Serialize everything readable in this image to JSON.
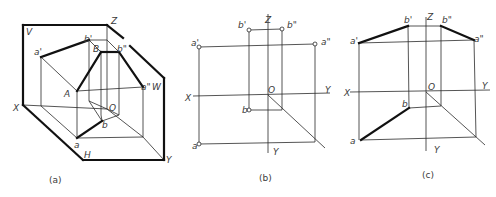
{
  "figure": {
    "colors": {
      "line": "#2a2a2a",
      "thick": "#111111",
      "text": "#3a3a3a",
      "background": "#ffffff"
    },
    "panels": [
      {
        "id": "a",
        "caption": "(a)",
        "caption_pos": [
          49,
          183
        ],
        "labels": [
          {
            "t": "V",
            "x": 26,
            "y": 35
          },
          {
            "t": "Z",
            "x": 111,
            "y": 24
          },
          {
            "t": "b'",
            "x": 84,
            "y": 42
          },
          {
            "t": "B",
            "x": 93,
            "y": 52
          },
          {
            "t": "b\"",
            "x": 117,
            "y": 52
          },
          {
            "t": "a'",
            "x": 34,
            "y": 55
          },
          {
            "t": "a\"",
            "x": 141,
            "y": 90
          },
          {
            "t": "W",
            "x": 152,
            "y": 90
          },
          {
            "t": "A",
            "x": 64,
            "y": 97
          },
          {
            "t": "X",
            "x": 13,
            "y": 111
          },
          {
            "t": "O",
            "x": 109,
            "y": 111
          },
          {
            "t": "b",
            "x": 102,
            "y": 128
          },
          {
            "t": "a",
            "x": 74,
            "y": 148
          },
          {
            "t": "H",
            "x": 84,
            "y": 158
          },
          {
            "t": "Y",
            "x": 166,
            "y": 163
          }
        ],
        "thick_lines": [
          [
            [
              23,
              25
            ],
            [
              107,
              25
            ]
          ],
          [
            [
              23,
              25
            ],
            [
              23,
              105
            ]
          ],
          [
            [
              23,
              105
            ],
            [
              83,
              160
            ]
          ],
          [
            [
              83,
              160
            ],
            [
              164,
              160
            ]
          ],
          [
            [
              164,
              160
            ],
            [
              164,
              78
            ]
          ],
          [
            [
              164,
              78
            ],
            [
              130,
              46
            ]
          ],
          [
            [
              107,
              25
            ],
            [
              123,
              38
            ]
          ],
          [
            [
              41,
              57
            ],
            [
              89,
              40
            ]
          ],
          [
            [
              77,
              91
            ],
            [
              101,
              52
            ]
          ],
          [
            [
              101,
              52
            ],
            [
              119,
              52
            ]
          ],
          [
            [
              119,
              52
            ],
            [
              143,
              87
            ]
          ],
          [
            [
              77,
              138
            ],
            [
              102,
              121
            ]
          ]
        ],
        "thin_lines": [
          [
            [
              41,
              57
            ],
            [
              77,
              91
            ]
          ],
          [
            [
              41,
              57
            ],
            [
              41,
              106
            ]
          ],
          [
            [
              89,
              40
            ],
            [
              107,
              40
            ]
          ],
          [
            [
              89,
              40
            ],
            [
              89,
              101
            ]
          ],
          [
            [
              89,
              40
            ],
            [
              101,
              52
            ]
          ],
          [
            [
              107,
              25
            ],
            [
              107,
              109
            ]
          ],
          [
            [
              107,
              40
            ],
            [
              119,
              52
            ]
          ],
          [
            [
              77,
              91
            ],
            [
              143,
              87
            ]
          ],
          [
            [
              77,
              91
            ],
            [
              77,
              138
            ]
          ],
          [
            [
              101,
              52
            ],
            [
              101,
              115
            ]
          ],
          [
            [
              119,
              52
            ],
            [
              119,
              115
            ]
          ],
          [
            [
              143,
              87
            ],
            [
              143,
              137
            ]
          ],
          [
            [
              23,
              105
            ],
            [
              107,
              109
            ]
          ],
          [
            [
              41,
              106
            ],
            [
              77,
              138
            ]
          ],
          [
            [
              77,
              138
            ],
            [
              143,
              137
            ]
          ],
          [
            [
              107,
              109
            ],
            [
              143,
              137
            ]
          ],
          [
            [
              143,
              137
            ],
            [
              164,
              160
            ]
          ],
          [
            [
              89,
              101
            ],
            [
              107,
              109
            ]
          ],
          [
            [
              89,
              101
            ],
            [
              102,
              121
            ]
          ],
          [
            [
              107,
              109
            ],
            [
              119,
              115
            ]
          ],
          [
            [
              102,
              121
            ],
            [
              119,
              115
            ]
          ],
          [
            [
              101,
              115
            ],
            [
              102,
              121
            ]
          ]
        ],
        "points": []
      },
      {
        "id": "b",
        "caption": "(b)",
        "caption_pos": [
          259,
          181
        ],
        "labels": [
          {
            "t": "Z",
            "x": 265,
            "y": 23
          },
          {
            "t": "b'",
            "x": 238,
            "y": 28
          },
          {
            "t": "b\"",
            "x": 287,
            "y": 28
          },
          {
            "t": "a'",
            "x": 191,
            "y": 46
          },
          {
            "t": "a\"",
            "x": 321,
            "y": 45
          },
          {
            "t": "X",
            "x": 185,
            "y": 101
          },
          {
            "t": "O",
            "x": 268,
            "y": 93
          },
          {
            "t": "Y",
            "x": 325,
            "y": 93
          },
          {
            "t": "b",
            "x": 242,
            "y": 113
          },
          {
            "t": "a",
            "x": 192,
            "y": 149
          },
          {
            "t": "Y",
            "x": 273,
            "y": 155
          }
        ],
        "thick_lines": [],
        "thin_lines": [
          [
            [
              268,
              14
            ],
            [
              268,
              153
            ]
          ],
          [
            [
              193,
              96
            ],
            [
              330,
              93
            ]
          ],
          [
            [
              199,
              47
            ],
            [
              315,
              44
            ]
          ],
          [
            [
              249,
              30
            ],
            [
              282,
              29
            ]
          ],
          [
            [
              199,
              47
            ],
            [
              199,
              144
            ]
          ],
          [
            [
              249,
              30
            ],
            [
              249,
              110
            ]
          ],
          [
            [
              282,
              29
            ],
            [
              282,
              110
            ]
          ],
          [
            [
              315,
              44
            ],
            [
              315,
              142
            ]
          ],
          [
            [
              249,
              110
            ],
            [
              282,
              110
            ]
          ],
          [
            [
              199,
              144
            ],
            [
              315,
              142
            ]
          ],
          [
            [
              268,
              95
            ],
            [
              325,
              148
            ]
          ]
        ],
        "points": [
          [
            199,
            47
          ],
          [
            315,
            44
          ],
          [
            249,
            30
          ],
          [
            282,
            29
          ],
          [
            249,
            110
          ],
          [
            199,
            144
          ]
        ]
      },
      {
        "id": "c",
        "caption": "(c)",
        "caption_pos": [
          422,
          178
        ],
        "labels": [
          {
            "t": "Z",
            "x": 427,
            "y": 20
          },
          {
            "t": "b'",
            "x": 404,
            "y": 23
          },
          {
            "t": "b\"",
            "x": 442,
            "y": 23
          },
          {
            "t": "a'",
            "x": 350,
            "y": 44
          },
          {
            "t": "a\"",
            "x": 474,
            "y": 42
          },
          {
            "t": "X",
            "x": 344,
            "y": 96
          },
          {
            "t": "O",
            "x": 428,
            "y": 90
          },
          {
            "t": "Y",
            "x": 482,
            "y": 89
          },
          {
            "t": "b",
            "x": 402,
            "y": 107
          },
          {
            "t": "a",
            "x": 350,
            "y": 144
          },
          {
            "t": "Y",
            "x": 434,
            "y": 153
          }
        ],
        "thick_lines": [
          [
            [
              359,
              43
            ],
            [
              408,
              26
            ]
          ],
          [
            [
              441,
              26
            ],
            [
              474,
              40
            ]
          ],
          [
            [
              361,
              140
            ],
            [
              409,
              108
            ]
          ]
        ],
        "thin_lines": [
          [
            [
              426,
              17
            ],
            [
              426,
              151
            ]
          ],
          [
            [
              350,
              92
            ],
            [
              490,
              90
            ]
          ],
          [
            [
              359,
              43
            ],
            [
              474,
              40
            ]
          ],
          [
            [
              408,
              26
            ],
            [
              441,
              26
            ]
          ],
          [
            [
              359,
              43
            ],
            [
              359,
              140
            ]
          ],
          [
            [
              408,
              26
            ],
            [
              409,
              108
            ]
          ],
          [
            [
              441,
              26
            ],
            [
              441,
              106
            ]
          ],
          [
            [
              474,
              40
            ],
            [
              476,
              137
            ]
          ],
          [
            [
              409,
              108
            ],
            [
              441,
              106
            ]
          ],
          [
            [
              361,
              140
            ],
            [
              476,
              137
            ]
          ],
          [
            [
              426,
              92
            ],
            [
              485,
              145
            ]
          ]
        ],
        "points": []
      }
    ]
  }
}
